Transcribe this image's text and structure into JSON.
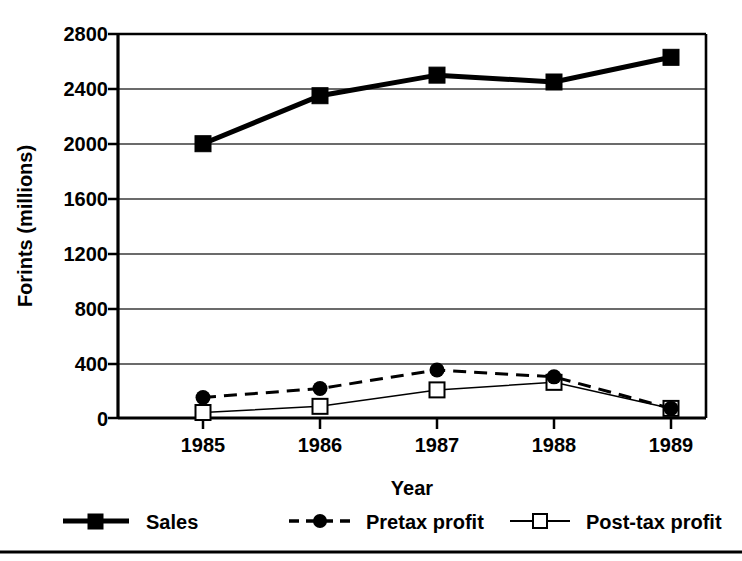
{
  "chart_data": {
    "type": "line",
    "title": "",
    "xlabel": "Year",
    "ylabel": "Forints (millions)",
    "categories": [
      "1985",
      "1986",
      "1987",
      "1988",
      "1989"
    ],
    "x": [
      1985,
      1986,
      1987,
      1988,
      1989
    ],
    "ylim": [
      0,
      2800
    ],
    "xlim": [
      1984.6,
      1989.4
    ],
    "yticks": [
      0,
      400,
      800,
      1200,
      1600,
      2000,
      2400,
      2800
    ],
    "ytick_labels": [
      "0",
      "400",
      "800",
      "1200",
      "1600",
      "2000",
      "2400",
      "2800"
    ],
    "xtick_labels": [
      "1985",
      "1986",
      "1987",
      "1988",
      "1989"
    ],
    "grid": "horizontal",
    "legend_position": "below-plot",
    "series": [
      {
        "name": "Sales",
        "values": [
          2000,
          2350,
          2500,
          2450,
          2630
        ],
        "line_style": "solid",
        "line_width": 5,
        "marker": "filled-square",
        "color": "#000000"
      },
      {
        "name": "Pretax profit",
        "values": [
          150,
          215,
          350,
          300,
          70
        ],
        "line_style": "dashed",
        "line_width": 3,
        "marker": "filled-circle",
        "color": "#000000"
      },
      {
        "name": "Post-tax profit",
        "values": [
          40,
          85,
          205,
          260,
          70
        ],
        "line_style": "solid",
        "line_width": 1.5,
        "marker": "open-square",
        "color": "#000000"
      }
    ]
  },
  "axes": {
    "y_title": "Forints (millions)",
    "x_title": "Year"
  },
  "legend": {
    "items": [
      {
        "label": "Sales",
        "key": "sales"
      },
      {
        "label": "Pretax profit",
        "key": "pretax-profit"
      },
      {
        "label": "Post-tax profit",
        "key": "post-tax-profit"
      }
    ]
  },
  "colors": {
    "ink": "#000000",
    "grid": "#4d4d4d",
    "background": "#ffffff",
    "footer_rule": "#000000"
  }
}
